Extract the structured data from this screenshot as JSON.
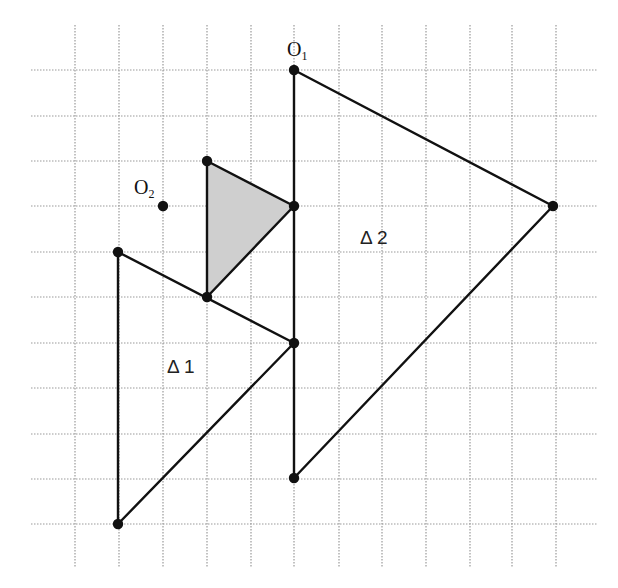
{
  "diagram": {
    "title": "",
    "grid": {
      "x_lines": [
        75,
        119,
        163,
        207,
        251,
        294,
        339,
        382,
        426,
        470,
        512,
        556
      ],
      "y_lines": [
        70,
        116,
        161,
        206,
        252,
        297,
        343,
        388,
        434,
        479,
        524
      ],
      "x_extent": [
        31,
        597
      ],
      "y_extent": [
        25,
        567
      ],
      "color": "#9a9a9a",
      "style": "dotted"
    },
    "points": {
      "O1": {
        "label": "O",
        "sub": "1",
        "x": 294,
        "y": 70
      },
      "O2": {
        "label": "O",
        "sub": "2",
        "x": 163,
        "y": 206
      }
    },
    "triangles": [
      {
        "name": "Δ 2",
        "label": "Δ 2",
        "vertices": [
          [
            294,
            70
          ],
          [
            553,
            206
          ],
          [
            294,
            478
          ]
        ],
        "fill": "none",
        "label_pos": [
          360,
          228
        ]
      },
      {
        "name": "Δ 1",
        "label": "Δ 1",
        "vertices": [
          [
            118,
            252
          ],
          [
            294,
            343
          ],
          [
            118,
            524
          ]
        ],
        "fill": "none",
        "label_pos": [
          167,
          357
        ]
      },
      {
        "name": "shaded",
        "label": "",
        "vertices": [
          [
            207,
            161
          ],
          [
            294,
            206
          ],
          [
            207,
            297
          ]
        ],
        "fill": "#cfcfcf"
      }
    ],
    "vertex_dots": [
      [
        294,
        70
      ],
      [
        553,
        206
      ],
      [
        294,
        478
      ],
      [
        118,
        252
      ],
      [
        294,
        343
      ],
      [
        118,
        524
      ],
      [
        207,
        161
      ],
      [
        294,
        206
      ],
      [
        207,
        297
      ],
      [
        163,
        206
      ]
    ],
    "colors": {
      "line": "#111111",
      "shade": "#cfcfcf",
      "grid": "#9a9a9a"
    }
  },
  "labels": {
    "o1_main": "O",
    "o1_sub": "1",
    "o2_main": "O",
    "o2_sub": "2",
    "delta1": "Δ 1",
    "delta2": "Δ 2"
  }
}
